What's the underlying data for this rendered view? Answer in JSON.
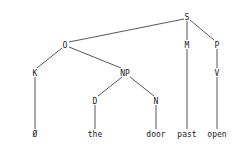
{
  "tree": {
    "nodes": {
      "S": {
        "label": "S",
        "x": 187,
        "y": 19
      },
      "O": {
        "label": "O",
        "x": 65,
        "y": 47
      },
      "M": {
        "label": "M",
        "x": 187,
        "y": 47
      },
      "P": {
        "label": "P",
        "x": 217,
        "y": 47
      },
      "K": {
        "label": "K",
        "x": 35,
        "y": 75
      },
      "NP": {
        "label": "NP",
        "x": 125,
        "y": 75
      },
      "V": {
        "label": "V",
        "x": 217,
        "y": 75
      },
      "D": {
        "label": "D",
        "x": 95,
        "y": 103
      },
      "N": {
        "label": "N",
        "x": 156,
        "y": 103
      },
      "w_null": {
        "label": "Ø",
        "x": 35,
        "y": 136
      },
      "w_the": {
        "label": "the",
        "x": 95,
        "y": 136
      },
      "w_door": {
        "label": "door",
        "x": 156,
        "y": 136
      },
      "w_past": {
        "label": "past",
        "x": 187,
        "y": 136
      },
      "w_open": {
        "label": "open",
        "x": 217,
        "y": 136
      }
    }
  }
}
